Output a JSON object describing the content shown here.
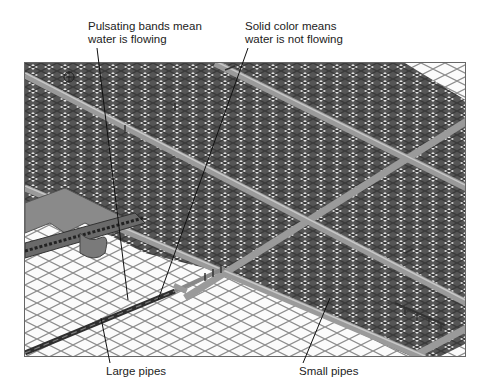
{
  "figure": {
    "view": "isometric water-pipe underground view",
    "callouts": {
      "pulsating": {
        "line1": "Pulsating bands mean",
        "line2": "water is flowing"
      },
      "solid": {
        "line1": "Solid color means",
        "line2": "water is not flowing"
      },
      "large_pipes": "Large pipes",
      "small_pipes": "Small pipes"
    },
    "colors": {
      "background": "#ffffff",
      "grid_line": "#8c8c8c",
      "dense_pipe_dark": "#4a4a4a",
      "dense_pipe_light": "#e6e6e6",
      "main_pipe": "#9a9a9a",
      "large_pipe": "#3a3a3a",
      "leader_line": "#111111"
    }
  }
}
